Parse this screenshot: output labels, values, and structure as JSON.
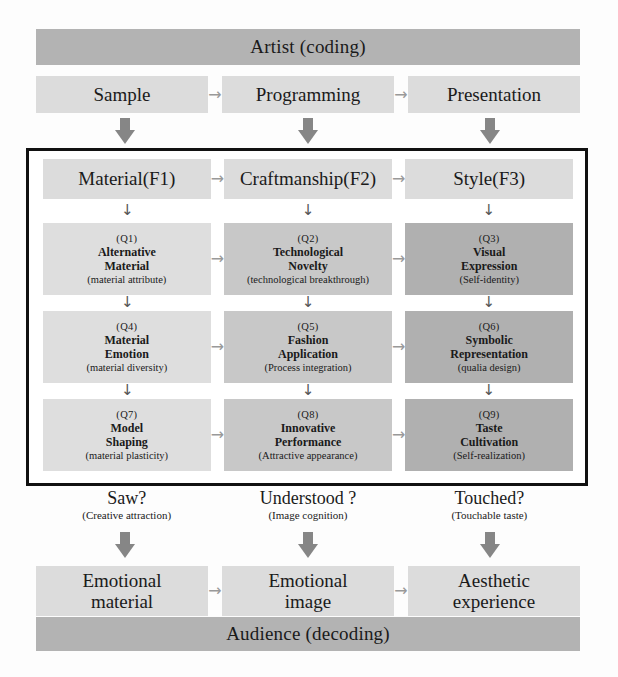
{
  "top_band": {
    "label": "Artist (coding)"
  },
  "bottom_band": {
    "label": "Audience (decoding)"
  },
  "stages": [
    {
      "label": "Sample"
    },
    {
      "label": "Programming"
    },
    {
      "label": "Presentation"
    }
  ],
  "factors": [
    {
      "label": "Material(F1)"
    },
    {
      "label": "Craftmanship(F2)"
    },
    {
      "label": "Style(F3)"
    }
  ],
  "matrix": {
    "rows": [
      {
        "cells": [
          {
            "num": "(Q1)",
            "title_line1": "Alternative",
            "title_line2": "Material",
            "sub": "(material  attribute)"
          },
          {
            "num": "(Q2)",
            "title_line1": "Technological",
            "title_line2": "Novelty",
            "sub": "(technological breakthrough)"
          },
          {
            "num": "(Q3)",
            "title_line1": "Visual",
            "title_line2": "Expression",
            "sub": "(Self-identity)"
          }
        ]
      },
      {
        "cells": [
          {
            "num": "(Q4)",
            "title_line1": "Material",
            "title_line2": "Emotion",
            "sub": "(material  diversity)"
          },
          {
            "num": "(Q5)",
            "title_line1": "Fashion",
            "title_line2": "Application",
            "sub": "(Process integration)"
          },
          {
            "num": "(Q6)",
            "title_line1": "Symbolic",
            "title_line2": "Representation",
            "sub": "(qualia design)"
          }
        ]
      },
      {
        "cells": [
          {
            "num": "(Q7)",
            "title_line1": "Model",
            "title_line2": "Shaping",
            "sub": "(material  plasticity)"
          },
          {
            "num": "(Q8)",
            "title_line1": "Innovative",
            "title_line2": "Performance",
            "sub": "(Attractive appearance)"
          },
          {
            "num": "(Q9)",
            "title_line1": "Taste",
            "title_line2": "Cultivation",
            "sub": "(Self-realization)"
          }
        ]
      }
    ]
  },
  "questions": [
    {
      "main": "Saw?",
      "sub": "(Creative attraction)"
    },
    {
      "main": "Understood ?",
      "sub": "(Image cognition)"
    },
    {
      "main": "Touched?",
      "sub": "(Touchable taste)"
    }
  ],
  "outcomes": [
    {
      "line1": "Emotional",
      "line2": "material"
    },
    {
      "line1": "Emotional",
      "line2": "image"
    },
    {
      "line1": "Aesthetic",
      "line2": "experience"
    }
  ],
  "glyphs": {
    "right_arrow": "→",
    "down_arrow": "↓"
  },
  "colors": {
    "band_dark": "#b3b3b3",
    "band_light": "#dcdcdc",
    "col1": "#dedede",
    "col2": "#c8c8c8",
    "col3": "#b0b0b0",
    "block_arrow": "#868686",
    "frame": "#111111"
  }
}
